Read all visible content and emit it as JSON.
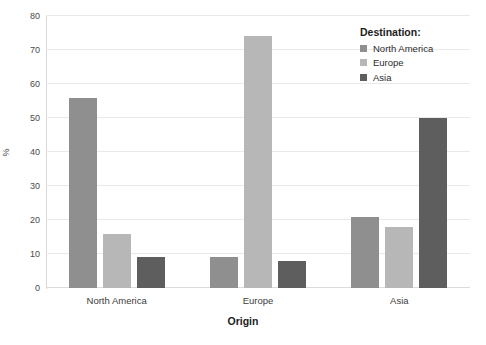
{
  "chart_data": {
    "type": "bar",
    "title": "",
    "subtitle": "",
    "xlabel": "Origin",
    "ylabel": "%",
    "categories": [
      "North America",
      "Europe",
      "Asia"
    ],
    "series": [
      {
        "name": "North America",
        "color": "#8f8f8f",
        "values": [
          56,
          9,
          21
        ]
      },
      {
        "name": "Europe",
        "color": "#b7b7b7",
        "values": [
          16,
          74,
          18
        ]
      },
      {
        "name": "Asia",
        "color": "#5e5e5e",
        "values": [
          9,
          8,
          50
        ]
      }
    ],
    "legend_title": "Destination:",
    "legend_position": "top-right",
    "ylim": [
      0,
      80
    ],
    "yticks": [
      0,
      10,
      20,
      30,
      40,
      50,
      60,
      70,
      80
    ],
    "ytick_labels": [
      "0",
      "10",
      "20",
      "30",
      "40",
      "50",
      "60",
      "70",
      "80"
    ],
    "grid": true,
    "grid_axis": "y"
  },
  "legend": {
    "title": "Destination:",
    "items": [
      {
        "label": "North America",
        "color": "#8f8f8f"
      },
      {
        "label": "Europe",
        "color": "#b7b7b7"
      },
      {
        "label": "Asia",
        "color": "#5e5e5e"
      }
    ]
  },
  "axes": {
    "x_title": "Origin",
    "y_title": "%"
  }
}
